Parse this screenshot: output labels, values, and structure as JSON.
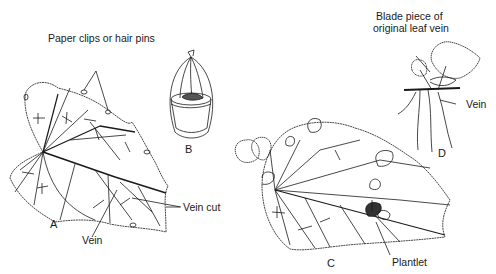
{
  "figures": {
    "A": {
      "letter": "A",
      "labels": {
        "clips": "Paper clips or hair pins",
        "vein_cut": "Vein cut",
        "vein": "Vein"
      }
    },
    "B": {
      "letter": "B"
    },
    "C": {
      "letter": "C",
      "labels": {
        "plantlet": "Plantlet"
      }
    },
    "D": {
      "letter": "D",
      "labels": {
        "blade_line1": "Blade piece of",
        "blade_line2": "original leaf vein",
        "vein": "Vein"
      }
    }
  },
  "colors": {
    "ink": "#1a1a1a",
    "background": "#ffffff"
  }
}
